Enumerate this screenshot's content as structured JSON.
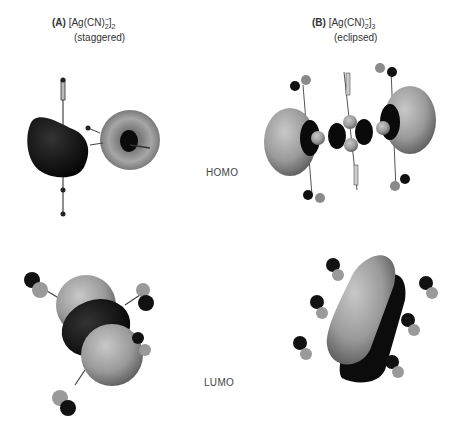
{
  "figure": {
    "panels": [
      {
        "letter": "(A)",
        "formula_base": "[Ag(CN)",
        "formula_sub": "2",
        "formula_sup": "−",
        "formula_close": "]",
        "formula_index": "2",
        "conformation": "(staggered)"
      },
      {
        "letter": "(B)",
        "formula_base": "[Ag(CN)",
        "formula_sub": "2",
        "formula_sup": "−",
        "formula_close": "]",
        "formula_index": "3",
        "conformation": "(eclipsed)"
      }
    ],
    "row_labels": [
      "HOMO",
      "LUMO"
    ],
    "colors": {
      "positive_lobe": "#9a9a9a",
      "negative_lobe": "#111111",
      "background": "#ffffff"
    }
  }
}
